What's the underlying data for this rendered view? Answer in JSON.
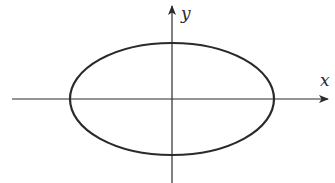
{
  "diagram": {
    "type": "ellipse-on-axes",
    "axes": {
      "x_label": "x",
      "y_label": "y"
    },
    "ellipse": {
      "center": [
        172,
        99
      ],
      "rx": 102,
      "ry": 56
    },
    "colors": {
      "stroke": "#2a2a2a",
      "background": "#ffffff"
    }
  }
}
